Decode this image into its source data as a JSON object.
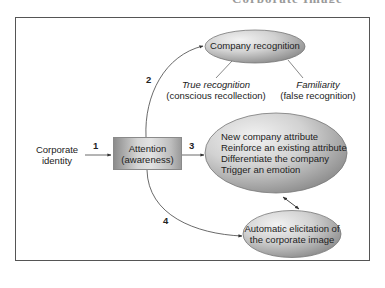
{
  "header": {
    "cut_off_text": "Corporate Image"
  },
  "diagram": {
    "source": {
      "line1": "Corporate",
      "line2": "identity"
    },
    "attention": {
      "line1": "Attention",
      "line2": "(awareness)"
    },
    "company_recognition": {
      "label": "Company recognition",
      "branches": [
        {
          "title": "True recognition",
          "subtitle": "(conscious recollection)"
        },
        {
          "title": "Familiarity",
          "subtitle": "(false recognition)"
        }
      ]
    },
    "attributes": {
      "lines": [
        "New company attribute",
        "Reinforce an existing attribute",
        "Differentiate the company",
        "Trigger an emotion"
      ]
    },
    "elicitation": {
      "line1": "Automatic elicitation of",
      "line2": "the corporate image"
    },
    "arrows": {
      "a1": "1",
      "a2": "2",
      "a3": "3",
      "a4": "4"
    }
  },
  "colors": {
    "frame_border": "#555555",
    "ellipse_light": "#ececec",
    "ellipse_dark": "#8a8a8a",
    "line": "#444444"
  }
}
